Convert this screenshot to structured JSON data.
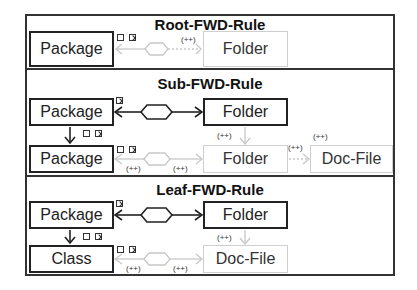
{
  "rules": [
    {
      "title": "Root-FWD-Rule",
      "nodes": [
        {
          "label": "Package",
          "style": "context"
        },
        {
          "label": "Folder",
          "style": "create"
        }
      ],
      "labels": [
        "(++)",
        "(++)"
      ]
    },
    {
      "title": "Sub-FWD-Rule",
      "nodes": [
        {
          "label": "Package",
          "style": "context"
        },
        {
          "label": "Folder",
          "style": "context"
        },
        {
          "label": "Package",
          "style": "context"
        },
        {
          "label": "Folder",
          "style": "create"
        },
        {
          "label": "Doc-File",
          "style": "create"
        }
      ],
      "labels": [
        "(++)",
        "(++)",
        "(++)",
        "(++)",
        "(++)",
        "(++)"
      ]
    },
    {
      "title": "Leaf-FWD-Rule",
      "nodes": [
        {
          "label": "Package",
          "style": "context"
        },
        {
          "label": "Folder",
          "style": "context"
        },
        {
          "label": "Class",
          "style": "context"
        },
        {
          "label": "Doc-File",
          "style": "create"
        }
      ],
      "labels": [
        "(++)",
        "(++)",
        "(++)",
        "(++)"
      ]
    }
  ],
  "colors": {
    "context_border": "#222222",
    "create_border": "#cfcfcf",
    "frame": "#333333"
  }
}
